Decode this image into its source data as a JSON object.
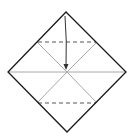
{
  "diagram": {
    "type": "origami-fold-step",
    "colors": {
      "outline": "#1a1a1a",
      "crease": "#a8a8a8",
      "dashed_fold": "#555555",
      "arrow": "#333333",
      "background": "#ffffff"
    },
    "square": {
      "top": [
        66,
        12
      ],
      "right": [
        126,
        72
      ],
      "bottom": [
        67,
        132
      ],
      "left": [
        8,
        72
      ],
      "center": [
        67,
        72
      ]
    },
    "creases": [
      {
        "name": "horizontal-diagonal",
        "from": [
          8,
          72
        ],
        "to": [
          126,
          72
        ]
      },
      {
        "name": "upper-left-crease",
        "from": [
          38,
          42
        ],
        "to": [
          67,
          72
        ]
      },
      {
        "name": "upper-right-crease",
        "from": [
          97,
          42
        ],
        "to": [
          67,
          72
        ]
      },
      {
        "name": "lower-left-crease",
        "from": [
          38,
          103
        ],
        "to": [
          67,
          72
        ]
      },
      {
        "name": "lower-right-crease",
        "from": [
          97,
          103
        ],
        "to": [
          67,
          72
        ]
      }
    ],
    "valley_folds": [
      {
        "name": "upper-dashed-fold",
        "from": [
          38,
          42
        ],
        "to": [
          97,
          42
        ]
      },
      {
        "name": "lower-dashed-fold",
        "from": [
          38,
          103
        ],
        "to": [
          97,
          103
        ]
      }
    ],
    "arrow": {
      "from": [
        65,
        16
      ],
      "to": [
        66,
        70
      ],
      "meaning": "fold top corner to center"
    }
  }
}
